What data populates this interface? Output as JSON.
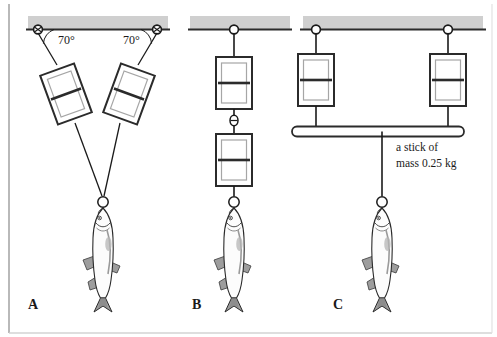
{
  "figure": {
    "background_color": "#ffffff",
    "border_color": "#b9b9b9",
    "ceiling_fill": "#cfcfcf",
    "ceiling_line_color": "#2b2b2b",
    "line_color": "#1a1a1a",
    "fish_body_fill": "#fdfdfd",
    "fish_fin_fill": "#a9a9a9",
    "scale_outer_fill": "#ffffff",
    "scale_inner_fill": "#ffffff",
    "scale_needle_color": "#2b2b2b"
  },
  "panels": [
    {
      "id": "A",
      "label": "A",
      "description": "Two scales hung at 70 degrees from ceiling, both attached to one fish",
      "scale_count": 2,
      "angles": [
        {
          "value": "70°",
          "side": "left"
        },
        {
          "value": "70°",
          "side": "right"
        }
      ]
    },
    {
      "id": "B",
      "label": "B",
      "description": "Two scales in series vertically, fish at bottom",
      "scale_count": 2,
      "angles": []
    },
    {
      "id": "C",
      "label": "C",
      "description": "Two scales side by side supporting a horizontal stick, fish hung from center of stick",
      "scale_count": 2,
      "angles": [],
      "stick": {
        "label_line_1": "a stick of",
        "label_line_2": "mass 0.25 kg"
      }
    }
  ]
}
